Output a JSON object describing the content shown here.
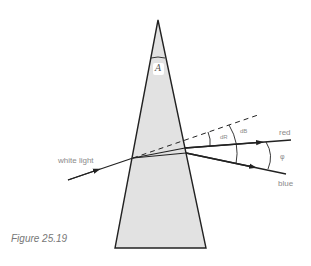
{
  "diagram": {
    "caption": "Figure 25.19",
    "labels": {
      "apex_angle": "A",
      "incident": "white light",
      "red_ray": "red",
      "blue_ray": "blue",
      "red_deviation": "dR",
      "blue_deviation": "dB",
      "dispersion_angle": "φ"
    },
    "colors": {
      "prism_fill": "#e2e2e2",
      "lines": "#222222",
      "label_text": "#8a8a8a"
    }
  }
}
